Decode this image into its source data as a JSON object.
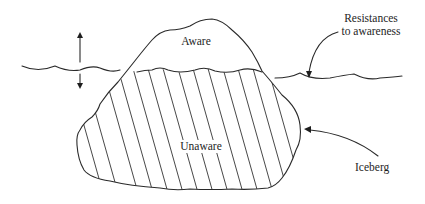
{
  "figure": {
    "labels": {
      "aware": "Aware",
      "unaware": "Unaware",
      "resistances_line1": "Resistances",
      "resistances_line2": "to awareness",
      "iceberg": "Iceberg"
    },
    "colors": {
      "line": "#2a2a2a",
      "background": "#ffffff"
    }
  }
}
